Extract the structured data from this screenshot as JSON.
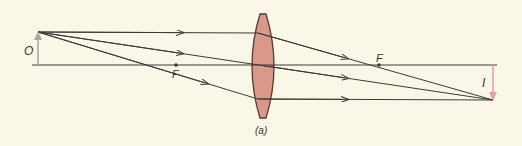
{
  "figure": {
    "caption": "(a)",
    "labels": {
      "object": "O",
      "image": "I",
      "focal_left": "F",
      "focal_right": "F"
    },
    "colors": {
      "background": "#fbf7e8",
      "lens_fill": "#d9998a",
      "lens_stroke": "#5a3a30",
      "ray": "#3a3a3a",
      "object_arrow": "#a9a9a9",
      "image_arrow": "#e2a49a"
    }
  }
}
